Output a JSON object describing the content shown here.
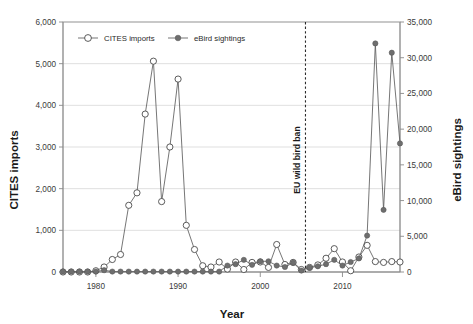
{
  "chart_data": {
    "type": "line",
    "title": "",
    "xlabel": "Year",
    "ylabel": "CITES imports",
    "y2label": "eBird sightings",
    "xlim": [
      1976,
      2017
    ],
    "ylim": [
      0,
      6000
    ],
    "y2lim": [
      0,
      35000
    ],
    "grid": true,
    "legend_position": "top-left-inside",
    "x_ticks": [
      1980,
      1990,
      2000,
      2010
    ],
    "x_tick_labels": [
      "1980",
      "1990",
      "2000",
      "2010"
    ],
    "y_ticks": [
      0,
      1000,
      2000,
      3000,
      4000,
      5000,
      6000
    ],
    "y_tick_labels": [
      "0",
      "1,000",
      "2,000",
      "3,000",
      "4,000",
      "5,000",
      "6,000"
    ],
    "y2_ticks": [
      0,
      5000,
      10000,
      15000,
      20000,
      25000,
      30000,
      35000
    ],
    "y2_tick_labels": [
      "0",
      "5,000",
      "10,000",
      "15,000",
      "20,000",
      "25,000",
      "30,000",
      "35,000"
    ],
    "annotations": [
      {
        "text": "EU wild bird ban",
        "x": 2005.5,
        "style": "vertical-dashed-line",
        "orientation": "vertical"
      }
    ],
    "x": [
      1976,
      1977,
      1978,
      1979,
      1980,
      1981,
      1982,
      1983,
      1984,
      1985,
      1986,
      1987,
      1988,
      1989,
      1990,
      1991,
      1992,
      1993,
      1994,
      1995,
      1996,
      1997,
      1998,
      1999,
      2000,
      2001,
      2002,
      2003,
      2004,
      2005,
      2006,
      2007,
      2008,
      2009,
      2010,
      2011,
      2012,
      2013,
      2014,
      2015,
      2016,
      2017
    ],
    "series": [
      {
        "name": "CITES imports",
        "axis": "left",
        "marker": "open-circle",
        "values": [
          0,
          0,
          0,
          0,
          30,
          120,
          300,
          420,
          1600,
          1900,
          3790,
          5060,
          1690,
          3000,
          4630,
          1120,
          540,
          150,
          120,
          240,
          70,
          240,
          60,
          230,
          240,
          110,
          660,
          180,
          230,
          60,
          110,
          170,
          330,
          560,
          240,
          30,
          360,
          640,
          250,
          230,
          250,
          240
        ]
      },
      {
        "name": "eBird sightings",
        "axis": "right",
        "marker": "filled-circle",
        "values": [
          60,
          60,
          60,
          60,
          60,
          250,
          60,
          60,
          60,
          60,
          60,
          60,
          60,
          60,
          60,
          60,
          60,
          60,
          60,
          60,
          900,
          1100,
          1700,
          1000,
          1500,
          1500,
          900,
          700,
          1300,
          200,
          600,
          800,
          1100,
          1700,
          900,
          1400,
          1900,
          5100,
          32000,
          8700,
          30700,
          18000
        ]
      }
    ]
  },
  "labels": {
    "ylabel": "CITES imports",
    "y2label": "eBird sightings",
    "xlabel": "Year",
    "annotation": "EU wild bird ban",
    "legend_cites": "CITES imports",
    "legend_ebird": "eBird sightings"
  },
  "colors": {
    "line": "#5d5d5d",
    "open_marker_fill": "#ffffff",
    "filled_marker": "#6e6e6e",
    "grid": "#d7d7d7",
    "text": "#1a1a1a",
    "annotation_line": "#2b2b2b"
  }
}
